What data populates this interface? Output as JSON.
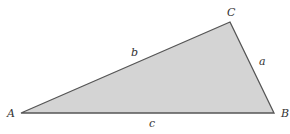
{
  "diagram": {
    "type": "triangle",
    "fill_color": "#d4d4d4",
    "stroke_color": "#555555",
    "vertices": [
      {
        "label": "A",
        "x": 21,
        "y": 113
      },
      {
        "label": "B",
        "x": 274,
        "y": 113
      },
      {
        "label": "C",
        "x": 230,
        "y": 22
      }
    ],
    "sides": [
      {
        "label": "a",
        "between": "B-C"
      },
      {
        "label": "b",
        "between": "A-C"
      },
      {
        "label": "c",
        "between": "A-B"
      }
    ]
  }
}
